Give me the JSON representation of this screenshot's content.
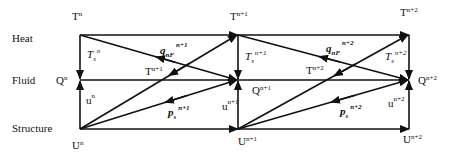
{
  "diagram": {
    "type": "staggered coupling scheme",
    "rows": [
      {
        "id": "heat",
        "label": "Heat"
      },
      {
        "id": "fluid",
        "label": "Fluid"
      },
      {
        "id": "structure",
        "label": "Structure"
      }
    ],
    "columns": [
      "n",
      "n+1",
      "n+2"
    ],
    "nodes": {
      "heat": [
        {
          "base": "T",
          "sup": "n"
        },
        {
          "base": "T",
          "sup": "n+1"
        },
        {
          "base": "T",
          "sup": "n+2"
        }
      ],
      "fluid": [
        {
          "base": "Q",
          "sup": "n"
        },
        {
          "base": "Q",
          "sup": "n+1"
        },
        {
          "base": "Q",
          "sup": "n+2"
        }
      ],
      "structure": [
        {
          "base": "U",
          "sup": "n"
        },
        {
          "base": "U",
          "sup": "n+1"
        },
        {
          "base": "U",
          "sup": "n+2"
        }
      ]
    },
    "edge_labels": {
      "block1": {
        "Ts": {
          "base": "T",
          "sub": "s",
          "sup": "n"
        },
        "u": {
          "base": "u",
          "sup": "n"
        },
        "q": {
          "base": "q",
          "sub": "nF",
          "sup": "n+1"
        },
        "T": {
          "base": "T",
          "sup": "n+1"
        },
        "p": {
          "base": "p",
          "sub": "s",
          "sup": "n+1"
        }
      },
      "block2": {
        "Ts": {
          "base": "T",
          "sub": "s",
          "sup": "n+1"
        },
        "u": {
          "base": "u",
          "sup": "n+1"
        },
        "q": {
          "base": "q",
          "sub": "nF",
          "sup": "n+2"
        },
        "T": {
          "base": "T",
          "sup": "n+2"
        },
        "p": {
          "base": "p",
          "sub": "s",
          "sup": "n+2"
        }
      },
      "block3": {
        "Ts": {
          "base": "T",
          "sub": "s",
          "sup": "n+2"
        },
        "u": {
          "base": "u",
          "sup": "n+2"
        }
      }
    },
    "colors": {
      "line": "#111111",
      "background": "#ffffff"
    }
  }
}
